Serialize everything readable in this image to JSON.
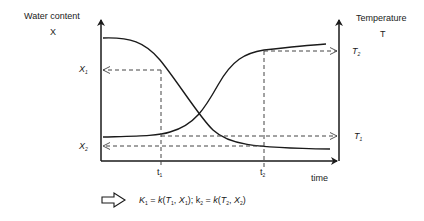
{
  "diagram": {
    "left_axis": {
      "title": "Water content",
      "symbol": "X"
    },
    "right_axis": {
      "title": "Temperature",
      "symbol": "T"
    },
    "x_axis": {
      "title": "time"
    },
    "left_marks": [
      {
        "base": "X",
        "sub": "1"
      },
      {
        "base": "X",
        "sub": "2"
      }
    ],
    "right_marks": [
      {
        "base": "T",
        "sub": "2"
      },
      {
        "base": "T",
        "sub": "1"
      }
    ],
    "time_marks": [
      {
        "base": "t",
        "sub": "1"
      },
      {
        "base": "t",
        "sub": "2"
      }
    ],
    "curves": [
      {
        "name": "water-content-curve",
        "description": "decreasing sigmoid from high X to X2"
      },
      {
        "name": "temperature-curve",
        "description": "increasing sigmoid from T1 to T2"
      }
    ],
    "formula": {
      "parts": [
        "K",
        "1",
        " = ",
        "k",
        "(",
        "T",
        "1",
        ", ",
        "X",
        "1",
        "); k",
        "2",
        " = ",
        "k",
        "(",
        "T",
        "2",
        ", ",
        "X",
        "2",
        ")"
      ]
    },
    "colors": {
      "line": "#1a1a1a",
      "dash": "#444444",
      "background": "#ffffff"
    }
  }
}
